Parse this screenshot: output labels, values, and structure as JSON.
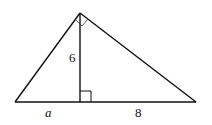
{
  "diagram": {
    "type": "right triangle with altitude to hypotenuse",
    "colors": {
      "stroke": "#111111",
      "background": "#ffffff"
    },
    "labels": {
      "altitude": "6",
      "left_segment": "a",
      "right_segment": "8"
    },
    "right_angles": [
      "apex",
      "altitude-foot"
    ]
  }
}
